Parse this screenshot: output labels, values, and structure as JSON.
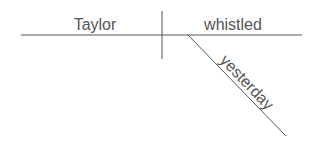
{
  "diagram": {
    "type": "sentence-diagram",
    "subject": "Taylor",
    "verb": "whistled",
    "modifier": "yesterday",
    "line_color": "#555555",
    "text_color": "#555555"
  }
}
